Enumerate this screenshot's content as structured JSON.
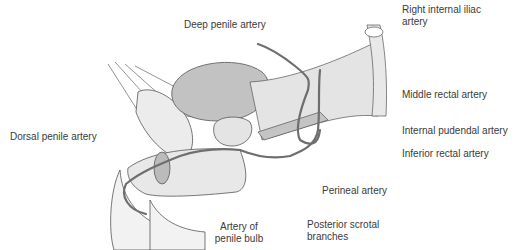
{
  "diagram": {
    "type": "anatomical illustration",
    "colors": {
      "artery": "#6e6e6e",
      "organ_fill": "#c4c4c4",
      "tissue_fill": "#e6e6e6",
      "outline": "#555555",
      "label_text": "#3a3a3a"
    },
    "labels": {
      "deep_penile_artery": "Deep penile artery",
      "right_internal_iliac_1": "Right internal iliac",
      "right_internal_iliac_2": "artery",
      "middle_rectal_artery": "Middle rectal artery",
      "internal_pudendal_artery": "Internal pudendal artery",
      "dorsal_penile_artery": "Dorsal penile artery",
      "inferior_rectal_artery": "Inferior rectal artery",
      "perineal_artery": "Perineal artery",
      "artery_penile_bulb_1": "Artery of",
      "artery_penile_bulb_2": "penile bulb",
      "posterior_scrotal_1": "Posterior scrotal",
      "posterior_scrotal_2": "branches"
    }
  }
}
